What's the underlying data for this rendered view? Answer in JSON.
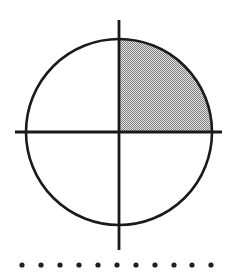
{
  "figure": {
    "canvas": {
      "width": 235,
      "height": 279,
      "background_color": "#ffffff"
    },
    "colors": {
      "stroke": "#1a1a1a",
      "shade_fill": "#b4b4b4",
      "shade_pattern_dark": "#7d7d7d",
      "shade_pattern_light": "#e6e6e6",
      "dot_color": "#1f1f1f",
      "background": "#ffffff"
    },
    "circle": {
      "label": "circle-outline",
      "center_x": 119,
      "center_y": 132,
      "radius": 93,
      "stroke_width": 2.6,
      "fill": "none"
    },
    "axes": {
      "vertical": {
        "label": "vertical-axis",
        "x": 119,
        "y_start": 20,
        "y_end": 250,
        "stroke_width": 2.8
      },
      "horizontal": {
        "label": "horizontal-axis",
        "y": 132,
        "x_start": 15,
        "x_end": 222,
        "stroke_width": 2.8
      }
    },
    "shaded_region": {
      "label": "upper-right-quadrant",
      "quadrant": "I",
      "description": "Quarter disc bounded by positive x-axis, positive y-axis and the circle arc",
      "fill_style": "checkerboard-dither-gray",
      "angle_start_deg": 0,
      "angle_end_deg": 90
    },
    "dot_row": {
      "label": "dot-row",
      "count": 11,
      "y": 265,
      "radius": 2.6,
      "x_positions": [
        22,
        41,
        60,
        79,
        98,
        117,
        136,
        155,
        174,
        192,
        211
      ]
    }
  }
}
